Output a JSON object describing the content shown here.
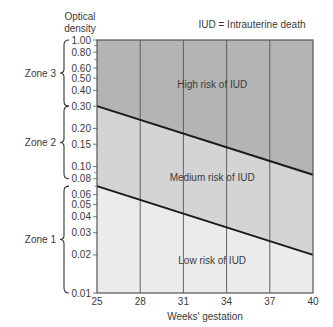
{
  "chart_data": {
    "type": "line",
    "title": "",
    "annotation": "IUD = Intrauterine death",
    "xlabel": "Weeks' gestation",
    "ylabel": "Optical density",
    "yscale": "log",
    "xlim": [
      25,
      40
    ],
    "ylim": [
      0.01,
      1.0
    ],
    "x_ticks": [
      25,
      28,
      31,
      34,
      37,
      40
    ],
    "y_ticks": [
      "1.00",
      "0.80",
      "0.60",
      "0.50",
      "0.40",
      "0.30",
      "0.20",
      "0.15",
      "0.10",
      "0.08",
      "0.06",
      "0.05",
      "0.04",
      "0.03",
      "0.02",
      "0.01"
    ],
    "grid": "vertical",
    "series": [
      {
        "name": "Upper boundary (Zone 3 / Zone 2)",
        "x": [
          25,
          40
        ],
        "values": [
          0.3,
          0.086
        ]
      },
      {
        "name": "Lower boundary (Zone 2 / Zone 1)",
        "x": [
          25,
          40
        ],
        "values": [
          0.07,
          0.02
        ]
      }
    ],
    "regions": [
      {
        "label": "High risk of IUD",
        "color": "#b4b4b4"
      },
      {
        "label": "Medium risk of IUD",
        "color": "#d4d4d4"
      },
      {
        "label": "Low risk of IUD",
        "color": "#ebebeb"
      }
    ],
    "zones": [
      {
        "label": "Zone 3",
        "range": [
          0.3,
          1.0
        ]
      },
      {
        "label": "Zone 2",
        "range": [
          0.08,
          0.3
        ]
      },
      {
        "label": "Zone 1",
        "range": [
          0.01,
          0.07
        ]
      }
    ]
  }
}
